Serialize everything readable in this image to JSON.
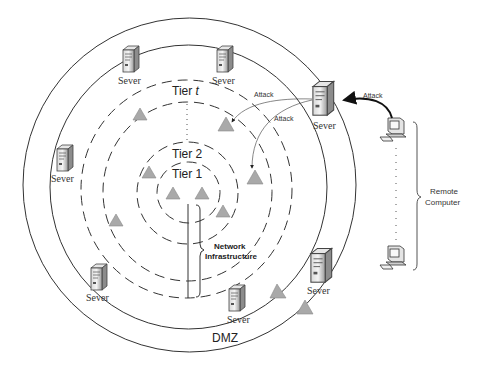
{
  "diagram": {
    "zones": {
      "dmz_label": "DMZ",
      "tier_t_label": "Tier ",
      "tier_t_var": "t",
      "tier_2_label": "Tier 2",
      "tier_1_label": "Tier 1",
      "network_label_line1": "Network",
      "network_label_line2": "Infrastructure"
    },
    "servers": [
      {
        "label": "Sever",
        "x": 130,
        "y": 58
      },
      {
        "label": "Sever",
        "x": 228,
        "y": 58
      },
      {
        "label": "Sever",
        "x": 66,
        "y": 158
      },
      {
        "label": "Sever",
        "x": 322,
        "y": 96
      },
      {
        "label": "Sever",
        "x": 100,
        "y": 272
      },
      {
        "label": "Sever",
        "x": 240,
        "y": 296
      },
      {
        "label": "Sever",
        "x": 320,
        "y": 262
      }
    ],
    "attack_labels": {
      "remote_to_server": "Attack",
      "server_to_tier_upper": "Attack",
      "server_to_tier_lower": "Attack"
    },
    "remote": {
      "label_line1": "Remote",
      "label_line2": "Computer"
    },
    "colors": {
      "triangle_fill": "#a9a9a9",
      "triangle_stroke": "#8a8a8a",
      "line": "#333333",
      "text": "#222222"
    }
  }
}
